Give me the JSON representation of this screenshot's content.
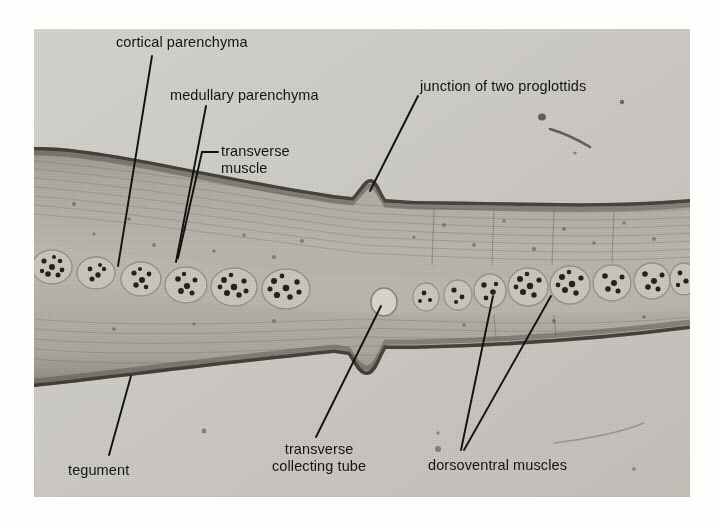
{
  "figure": {
    "kind": "light-micrograph",
    "background_color": "#ffffff",
    "photo_tone": "#cfcdc8"
  },
  "labels": [
    {
      "id": "cortical-parenchyma",
      "text": "cortical parenchyma",
      "x": 116,
      "y": 34,
      "lines": [
        "cortical parenchyma"
      ]
    },
    {
      "id": "medullary-parenchyma",
      "text": "medullary parenchyma",
      "x": 170,
      "y": 87,
      "lines": [
        "medullary parenchyma"
      ]
    },
    {
      "id": "transverse-muscle",
      "text": "transverse muscle",
      "x": 221,
      "y": 143,
      "lines": [
        "transverse",
        "muscle"
      ]
    },
    {
      "id": "junction-proglottids",
      "text": "junction of two proglottids",
      "x": 420,
      "y": 78,
      "lines": [
        "junction of two proglottids"
      ]
    },
    {
      "id": "tegument",
      "text": "tegument",
      "x": 68,
      "y": 462,
      "lines": [
        "tegument"
      ]
    },
    {
      "id": "transverse-collecting-tube",
      "text": "transverse collecting tube",
      "x": 272,
      "y": 441,
      "lines": [
        "transverse",
        "collecting tube"
      ]
    },
    {
      "id": "dorsoventral-muscles",
      "text": "dorsoventral muscles",
      "x": 428,
      "y": 457,
      "lines": [
        "dorsoventral muscles"
      ]
    }
  ],
  "leader_lines": [
    {
      "id": "leader-cortical-parenchyma",
      "points": "152,56 118,266"
    },
    {
      "id": "leader-medullary-parenchyma",
      "points": "206,106 176,262"
    },
    {
      "id": "leader-transverse-muscle",
      "points": "218,152 202,152 178,258"
    },
    {
      "id": "leader-junction-proglottids",
      "points": "418,96 370,191"
    },
    {
      "id": "leader-tegument",
      "points": "131,376 109,455"
    },
    {
      "id": "leader-collecting-tube",
      "points": "381,306 316,437"
    },
    {
      "id": "leader-dorsoventral-a",
      "points": "493,296 461,450"
    },
    {
      "id": "leader-dorsoventral-b",
      "points": "551,296 464,450"
    }
  ],
  "structures": {
    "tegument_color": "#3a372f",
    "parenchyma_color": "#b8b4ac",
    "medullary_body_color": "#2d2a24",
    "collecting_tube_fill": "#dcd9d2",
    "medullary_bodies_count": 17,
    "collecting_tube_position": {
      "x": 350,
      "y": 273,
      "rx": 13,
      "ry": 14
    }
  }
}
